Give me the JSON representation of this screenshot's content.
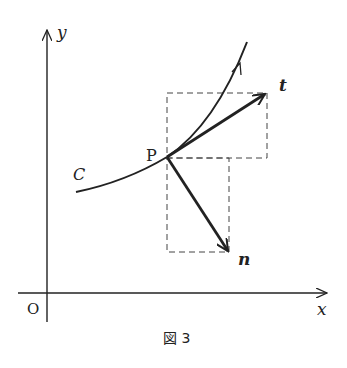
{
  "figure": {
    "caption": "図 3",
    "labels": {
      "y_axis": "y",
      "x_axis": "x",
      "origin": "O",
      "point": "P",
      "curve": "C",
      "tangent_vector": "t",
      "normal_vector": "n"
    },
    "colors": {
      "ink": "#222222",
      "background": "#ffffff"
    },
    "geometry": {
      "origin_px": [
        47,
        293
      ],
      "point_P_px": [
        167,
        157
      ],
      "tangent_tip_px": [
        266,
        93
      ],
      "normal_tip_px": [
        229,
        252
      ],
      "tangent_box_px": {
        "x": 167,
        "y": 93,
        "w": 100,
        "h": 65
      },
      "normal_box_px": {
        "x": 167,
        "y": 158,
        "w": 62,
        "h": 94
      }
    }
  }
}
